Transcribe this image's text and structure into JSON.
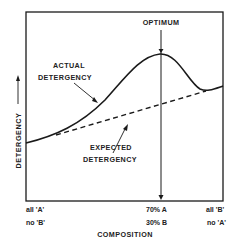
{
  "diagram": {
    "title": "",
    "y_axis_label": "DETERGENCY",
    "x_axis_label": "COMPOSITION",
    "annotations": {
      "optimum": "OPTIMUM",
      "actual_line1": "ACTUAL",
      "actual_line2": "DETERGENCY",
      "expected_line1": "EXPECTED",
      "expected_line2": "DETERGENCY"
    },
    "x_ticks": {
      "left_line1": "all 'A'",
      "left_line2": "no 'B'",
      "mid_line1": "70% A",
      "mid_line2": "30% B",
      "right_line1": "all 'B'",
      "right_line2": "no 'A'"
    },
    "curves": [
      {
        "name": "Actual Detergency",
        "style": "solid"
      },
      {
        "name": "Expected Detergency",
        "style": "dashed"
      }
    ],
    "colors": {
      "line": "#1a1a1a",
      "background": "#ffffff"
    }
  }
}
